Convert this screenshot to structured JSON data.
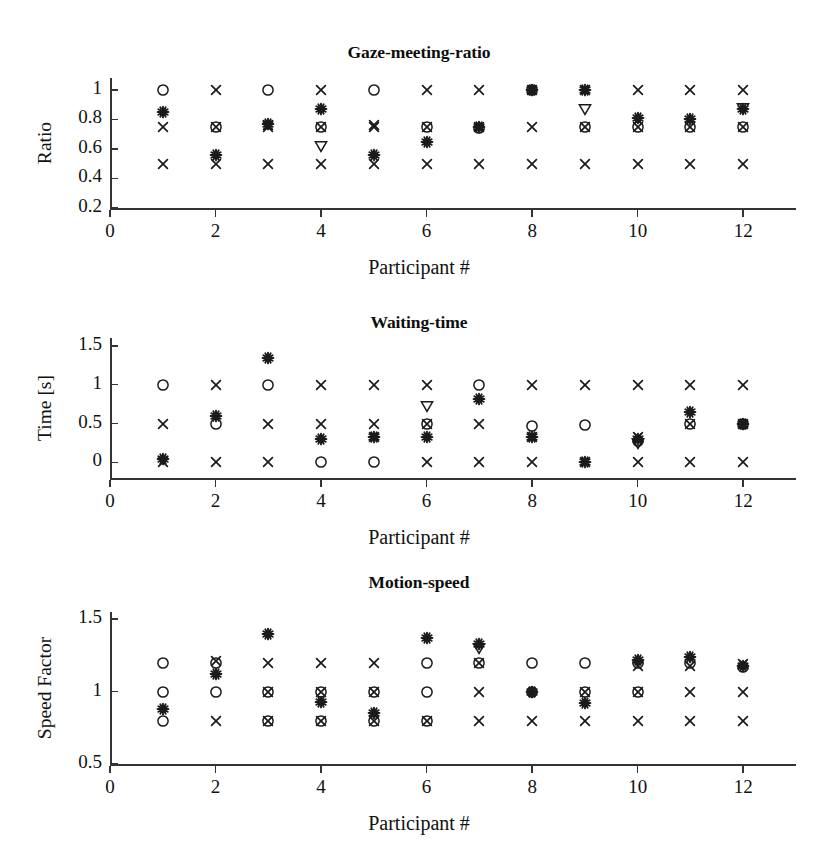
{
  "figure": {
    "xlabel": "Participant #",
    "x_ticks": [
      0,
      2,
      4,
      6,
      8,
      10,
      12
    ],
    "x_range": [
      0,
      13
    ],
    "marker_kinds": [
      "circle",
      "cross",
      "asterisk",
      "triangle-down"
    ],
    "ink_color": "#1a1a1a"
  },
  "chart_data": [
    {
      "type": "scatter",
      "title": "Gaze-meeting-ratio",
      "xlabel": "Participant #",
      "ylabel": "Ratio",
      "xlim": [
        0,
        13
      ],
      "ylim": [
        0.2,
        1.08
      ],
      "xticks": [
        0,
        2,
        4,
        6,
        8,
        10,
        12
      ],
      "yticks": [
        0.2,
        0.4,
        0.6,
        0.8,
        1
      ],
      "ytick_labels": [
        "0.2",
        "0.4",
        "0.6",
        "0.8",
        "1"
      ],
      "grid": false,
      "legend": "none",
      "x": [
        1,
        2,
        3,
        4,
        5,
        6,
        7,
        8,
        9,
        10,
        11,
        12
      ],
      "series": [
        {
          "name": "circle",
          "marker": "circle",
          "values": [
            1.0,
            0.75,
            1.0,
            0.75,
            1.0,
            0.75,
            0.74,
            1.0,
            0.75,
            0.75,
            0.75,
            0.75
          ]
        },
        {
          "name": "cross-high",
          "marker": "cross",
          "values": [
            0.75,
            1.0,
            0.75,
            1.0,
            0.75,
            1.0,
            1.0,
            1.0,
            1.0,
            1.0,
            1.0,
            1.0
          ]
        },
        {
          "name": "cross-low",
          "marker": "cross",
          "values": [
            0.5,
            0.5,
            0.5,
            0.5,
            0.5,
            0.5,
            0.5,
            0.5,
            0.5,
            0.5,
            0.5,
            0.5
          ]
        },
        {
          "name": "cross-mid",
          "marker": "cross",
          "values": [
            null,
            0.75,
            0.76,
            0.75,
            0.76,
            0.75,
            0.75,
            0.75,
            0.75,
            0.75,
            0.75,
            0.75
          ]
        },
        {
          "name": "asterisk",
          "marker": "asterisk",
          "values": [
            0.85,
            0.56,
            0.77,
            0.87,
            0.56,
            0.65,
            0.75,
            1.0,
            1.0,
            0.81,
            0.8,
            0.87
          ]
        },
        {
          "name": "triangle-down",
          "marker": "triangle-down",
          "values": [
            null,
            null,
            null,
            0.62,
            null,
            null,
            null,
            null,
            0.87,
            null,
            null,
            0.88
          ]
        }
      ]
    },
    {
      "type": "scatter",
      "title": "Waiting-time",
      "xlabel": "Participant #",
      "ylabel": "Time [s]",
      "xlim": [
        0,
        13
      ],
      "ylim": [
        -0.2,
        1.6
      ],
      "xticks": [
        0,
        2,
        4,
        6,
        8,
        10,
        12
      ],
      "yticks": [
        0,
        0.5,
        1,
        1.5
      ],
      "ytick_labels": [
        "0",
        "0.5",
        "1",
        "1.5"
      ],
      "grid": false,
      "legend": "none",
      "x": [
        1,
        2,
        3,
        4,
        5,
        6,
        7,
        8,
        9,
        10,
        11,
        12
      ],
      "series": [
        {
          "name": "circle",
          "marker": "circle",
          "values": [
            1.0,
            0.5,
            1.0,
            0.0,
            0.0,
            0.5,
            1.0,
            0.47,
            0.48,
            0.28,
            0.5,
            0.49
          ]
        },
        {
          "name": "cross-high",
          "marker": "cross",
          "values": [
            0.5,
            1.0,
            0.49,
            1.0,
            1.0,
            1.0,
            0.5,
            1.0,
            1.0,
            1.0,
            1.0,
            1.0
          ]
        },
        {
          "name": "cross-low",
          "marker": "cross",
          "values": [
            0.0,
            0.0,
            0.0,
            0.49,
            0.49,
            0.0,
            0.0,
            0.0,
            0.0,
            0.0,
            0.0,
            0.0
          ]
        },
        {
          "name": "cross-mid",
          "marker": "cross",
          "values": [
            null,
            null,
            null,
            null,
            0.33,
            0.5,
            null,
            0.33,
            null,
            0.33,
            0.5,
            0.5
          ]
        },
        {
          "name": "asterisk",
          "marker": "asterisk",
          "values": [
            0.04,
            0.6,
            1.34,
            0.3,
            0.33,
            0.33,
            0.82,
            0.33,
            0.0,
            0.3,
            0.65,
            0.5
          ]
        },
        {
          "name": "triangle-down",
          "marker": "triangle-down",
          "values": [
            null,
            null,
            null,
            null,
            null,
            0.72,
            null,
            null,
            null,
            0.25,
            null,
            null
          ]
        }
      ]
    },
    {
      "type": "scatter",
      "title": "Motion-speed",
      "xlabel": "Participant #",
      "ylabel": "Speed Factor",
      "xlim": [
        0,
        13
      ],
      "ylim": [
        0.5,
        1.55
      ],
      "xticks": [
        0,
        2,
        4,
        6,
        8,
        10,
        12
      ],
      "yticks": [
        0.5,
        1,
        1.5
      ],
      "ytick_labels": [
        "0.5",
        "1",
        "1.5"
      ],
      "grid": false,
      "legend": "none",
      "x": [
        1,
        2,
        3,
        4,
        5,
        6,
        7,
        8,
        9,
        10,
        11,
        12
      ],
      "series": [
        {
          "name": "circle-high",
          "marker": "circle",
          "values": [
            1.2,
            1.0,
            0.8,
            0.8,
            1.0,
            1.2,
            1.2,
            1.2,
            1.2,
            1.2,
            1.2,
            1.17
          ]
        },
        {
          "name": "circle-mid",
          "marker": "circle",
          "values": [
            1.0,
            1.2,
            1.0,
            1.0,
            0.8,
            1.0,
            null,
            1.0,
            1.0,
            1.0,
            null,
            null
          ]
        },
        {
          "name": "circle-low",
          "marker": "circle",
          "values": [
            0.8,
            null,
            null,
            null,
            null,
            0.8,
            null,
            null,
            null,
            null,
            null,
            null
          ]
        },
        {
          "name": "cross-high",
          "marker": "cross",
          "values": [
            null,
            1.21,
            1.2,
            1.2,
            1.2,
            null,
            1.2,
            null,
            null,
            1.18,
            1.18,
            1.19
          ]
        },
        {
          "name": "cross-mid",
          "marker": "cross",
          "values": [
            null,
            null,
            1.0,
            1.0,
            1.0,
            null,
            1.0,
            null,
            1.0,
            1.0,
            1.0,
            1.0
          ]
        },
        {
          "name": "cross-low",
          "marker": "cross",
          "values": [
            null,
            0.8,
            0.8,
            0.8,
            0.8,
            0.8,
            0.8,
            0.8,
            0.8,
            0.8,
            0.8,
            0.8
          ]
        },
        {
          "name": "asterisk",
          "marker": "asterisk",
          "values": [
            0.88,
            1.12,
            1.4,
            0.93,
            0.85,
            1.37,
            1.33,
            1.0,
            0.92,
            1.22,
            1.24,
            1.18
          ]
        },
        {
          "name": "triangle-down",
          "marker": "triangle-down",
          "values": [
            null,
            null,
            null,
            null,
            null,
            null,
            1.3,
            null,
            null,
            null,
            null,
            null
          ]
        }
      ]
    }
  ]
}
